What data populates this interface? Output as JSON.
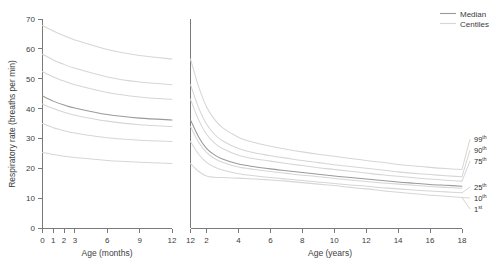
{
  "figure": {
    "ylabel": "Respiratory rate (breaths per min)",
    "panel_left_xlabel": "Age (months)",
    "panel_right_xlabel": "Age (years)"
  },
  "legend": {
    "position": "top-right",
    "items": [
      {
        "label": "Median",
        "color": "#9a9a9a"
      },
      {
        "label": "Centiles",
        "color": "#d6d6d6"
      }
    ]
  },
  "axes": {
    "y_ticks": [
      "0",
      "10",
      "20",
      "30",
      "40",
      "50",
      "60",
      "70"
    ],
    "y_values": [
      0,
      10,
      20,
      30,
      40,
      50,
      60,
      70
    ],
    "left_x_ticks": [
      "0",
      "1",
      "2",
      "3",
      "6",
      "9",
      "12"
    ],
    "left_x_values": [
      0,
      1,
      2,
      3,
      6,
      9,
      12
    ],
    "right_x_ticks": [
      "12",
      "2",
      "4",
      "6",
      "8",
      "10",
      "12",
      "14",
      "16",
      "18"
    ],
    "right_x_values": [
      1,
      2,
      4,
      6,
      8,
      10,
      12,
      14,
      16,
      18
    ]
  },
  "percentile_labels": [
    {
      "value": "99",
      "suffix": "th"
    },
    {
      "value": "90",
      "suffix": "th"
    },
    {
      "value": "75",
      "suffix": "th"
    },
    {
      "value": "25",
      "suffix": "th"
    },
    {
      "value": "10",
      "suffix": "th"
    },
    {
      "value": "1",
      "suffix": "st"
    }
  ],
  "chart_data": {
    "type": "line",
    "title": "",
    "xlabel": "Age (months) / Age (years)",
    "ylabel": "Respiratory rate (breaths per min)",
    "ylim": [
      0,
      70
    ],
    "grid": false,
    "legend_position": "top-right",
    "panels": [
      {
        "name": "infant",
        "xlabel": "Age (months)",
        "xlim": [
          0,
          12
        ],
        "x_unit": "months",
        "x": [
          0,
          1,
          2,
          3,
          6,
          9,
          12
        ],
        "series": [
          {
            "name": "99th centile",
            "percentile": 99,
            "values": [
              67.8,
              66.0,
              64.4,
              63.0,
              59.8,
              57.8,
              56.6
            ]
          },
          {
            "name": "90th centile",
            "percentile": 90,
            "values": [
              58.2,
              56.3,
              54.8,
              53.5,
              50.6,
              48.9,
              48.0
            ]
          },
          {
            "name": "75th centile",
            "percentile": 75,
            "values": [
              52.4,
              50.6,
              49.2,
              48.0,
              45.4,
              43.9,
              43.1
            ]
          },
          {
            "name": "Median",
            "percentile": 50,
            "values": [
              44.2,
              42.5,
              41.2,
              40.2,
              38.0,
              36.8,
              36.2
            ]
          },
          {
            "name": "50th lower band",
            "percentile": 45,
            "values": [
              41.5,
              40.0,
              38.8,
              37.8,
              35.8,
              34.6,
              34.0
            ]
          },
          {
            "name": "25th centile",
            "percentile": 25,
            "values": [
              35.0,
              33.6,
              32.6,
              31.8,
              30.2,
              29.4,
              29.0
            ]
          },
          {
            "name": "10th centile",
            "percentile": 10,
            "values": [
              25.3,
              24.6,
              24.0,
              23.6,
              22.6,
              22.0,
              21.6
            ]
          }
        ]
      },
      {
        "name": "childhood",
        "xlabel": "Age (years)",
        "xlim": [
          1,
          18
        ],
        "x_unit": "years",
        "x": [
          1,
          1.5,
          2,
          2.5,
          3,
          4,
          5,
          6,
          7,
          8,
          9,
          10,
          11,
          12,
          13,
          14,
          15,
          16,
          17,
          18
        ],
        "series": [
          {
            "name": "99th centile",
            "percentile": 99,
            "values": [
              56.6,
              47.5,
              40.6,
              36.4,
              33.6,
              30.4,
              28.6,
              27.4,
              26.4,
              25.5,
              24.7,
              24.0,
              23.3,
              22.6,
              22.0,
              21.3,
              20.8,
              20.3,
              19.9,
              19.6
            ]
          },
          {
            "name": "90th centile",
            "percentile": 90,
            "values": [
              48.0,
              40.4,
              34.8,
              31.4,
              29.2,
              26.6,
              25.2,
              24.2,
              23.4,
              22.6,
              21.9,
              21.2,
              20.6,
              20.0,
              19.4,
              18.8,
              18.3,
              17.9,
              17.5,
              17.2
            ]
          },
          {
            "name": "75th centile",
            "percentile": 75,
            "values": [
              43.1,
              36.3,
              31.4,
              28.5,
              26.6,
              24.4,
              23.2,
              22.4,
              21.6,
              20.9,
              20.2,
              19.6,
              19.0,
              18.4,
              17.8,
              17.3,
              16.8,
              16.4,
              16.0,
              15.7
            ]
          },
          {
            "name": "Median",
            "percentile": 50,
            "values": [
              36.2,
              30.6,
              26.7,
              24.5,
              23.1,
              21.4,
              20.5,
              19.8,
              19.2,
              18.6,
              18.0,
              17.4,
              16.9,
              16.4,
              15.9,
              15.4,
              15.0,
              14.6,
              14.3,
              14.0
            ]
          },
          {
            "name": "50th lower band",
            "percentile": 45,
            "values": [
              34.0,
              28.8,
              25.3,
              23.3,
              22.0,
              20.4,
              19.6,
              18.9,
              18.3,
              17.7,
              17.2,
              16.6,
              16.1,
              15.6,
              15.1,
              14.7,
              14.3,
              13.9,
              13.6,
              13.3
            ]
          },
          {
            "name": "25th centile",
            "percentile": 25,
            "values": [
              29.0,
              24.8,
              22.0,
              20.4,
              19.4,
              18.2,
              17.5,
              16.9,
              16.4,
              15.9,
              15.4,
              14.9,
              14.4,
              14.0,
              13.5,
              13.1,
              12.7,
              12.4,
              12.1,
              11.8
            ]
          },
          {
            "name": "10th centile",
            "percentile": 10,
            "values": [
              21.6,
              19.0,
              17.4,
              17.0,
              16.9,
              16.7,
              16.4,
              16.1,
              15.7,
              15.2,
              14.7,
              14.2,
              13.6,
              13.1,
              12.5,
              12.0,
              11.5,
              11.0,
              10.6,
              10.2
            ]
          }
        ]
      }
    ],
    "annotations": [
      "99th",
      "90th",
      "75th",
      "25th",
      "10th",
      "1st"
    ]
  }
}
